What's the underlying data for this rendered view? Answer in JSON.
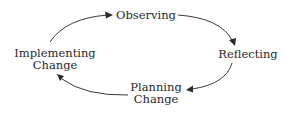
{
  "diagram": {
    "type": "cycle",
    "direction": "clockwise",
    "nodes": [
      {
        "id": "observing",
        "lines": [
          "Observing"
        ]
      },
      {
        "id": "reflecting",
        "lines": [
          "Reflecting"
        ]
      },
      {
        "id": "planning",
        "lines": [
          "Planning",
          "Change"
        ]
      },
      {
        "id": "implementing",
        "lines": [
          "Implementing",
          "Change"
        ]
      }
    ],
    "edges": [
      {
        "from": "implementing",
        "to": "observing"
      },
      {
        "from": "observing",
        "to": "reflecting"
      },
      {
        "from": "reflecting",
        "to": "planning"
      },
      {
        "from": "planning",
        "to": "implementing"
      }
    ],
    "colors": {
      "text": "#2a2a2a",
      "arrow": "#3a3a3a",
      "background": "#ffffff"
    }
  }
}
